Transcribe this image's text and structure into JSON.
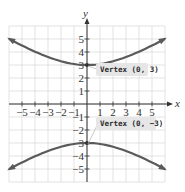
{
  "chart_data": {
    "type": "line",
    "title": "",
    "xlabel": "x",
    "ylabel": "y",
    "xlim": [
      -6,
      6
    ],
    "ylim": [
      -6,
      6
    ],
    "grid": true,
    "x_ticks": [
      -5,
      -4,
      -3,
      -2,
      -1,
      1,
      2,
      3,
      4,
      5
    ],
    "y_ticks": [
      -5,
      -4,
      -3,
      -2,
      -1,
      1,
      2,
      3,
      4,
      5
    ],
    "x_tick_labels": [
      "−5",
      "−4",
      "−3",
      "−2",
      "−1",
      "1",
      "2",
      "3",
      "4",
      "5"
    ],
    "y_tick_labels": [
      "−5",
      "−4",
      "−3",
      "−2",
      "−1",
      "1",
      "2",
      "3",
      "4",
      "5"
    ],
    "series": [
      {
        "name": "upper branch (opens up)",
        "vertex": [
          0,
          3
        ],
        "x": [
          -6,
          -5,
          -4,
          -3,
          -2,
          -1,
          0,
          1,
          2,
          3,
          4,
          5,
          6
        ],
        "y": [
          5.4,
          4.7,
          4.1,
          3.6,
          3.25,
          3.05,
          3,
          3.05,
          3.25,
          3.6,
          4.1,
          4.7,
          5.4
        ]
      },
      {
        "name": "lower branch (opens down)",
        "vertex": [
          0,
          -3
        ],
        "x": [
          -6,
          -5,
          -4,
          -3,
          -2,
          -1,
          0,
          1,
          2,
          3,
          4,
          5,
          6
        ],
        "y": [
          -5.4,
          -4.7,
          -4.1,
          -3.6,
          -3.25,
          -3.05,
          -3,
          -3.05,
          -3.25,
          -3.6,
          -4.1,
          -4.7,
          -5.4
        ]
      }
    ],
    "annotations": [
      {
        "text": "Vertex (0, 3)",
        "point": [
          0,
          3
        ]
      },
      {
        "text": "Vertex (0, −3)",
        "point": [
          0,
          -3
        ]
      }
    ]
  },
  "colors": {
    "curve": "#5a5a5a",
    "grid": "#dcdcdc",
    "axis": "#333333",
    "callout_bg": "#e6e6e6"
  }
}
